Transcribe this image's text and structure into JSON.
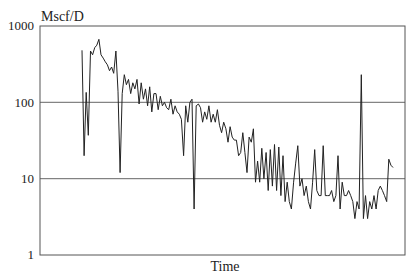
{
  "chart_data": {
    "type": "line",
    "title": "",
    "xlabel": "Time",
    "ylabel": "Mscf/D",
    "yscale": "log",
    "ylim": [
      1,
      1000
    ],
    "yticks": [
      1,
      10,
      100,
      1000
    ],
    "ytick_labels": [
      "1",
      "10",
      "100",
      "1000"
    ],
    "grid": {
      "horizontal": [
        10,
        100
      ],
      "vertical": false
    },
    "legend": null,
    "series": [
      {
        "name": "Gas rate",
        "color": "#222222",
        "x": [
          0,
          1,
          2,
          3,
          4,
          5,
          6,
          7,
          8,
          9,
          10,
          11,
          12,
          13,
          14,
          15,
          16,
          17,
          18,
          19,
          20,
          21,
          22,
          23,
          24,
          25,
          26,
          27,
          28,
          29,
          30,
          31,
          32,
          33,
          34,
          35,
          36,
          37,
          38,
          39,
          40,
          41,
          42,
          43,
          44,
          45,
          46,
          47,
          48,
          49,
          50,
          51,
          52,
          53,
          54,
          55,
          56,
          57,
          58,
          59,
          60,
          61,
          62,
          63,
          64,
          65,
          66,
          67,
          68,
          69,
          70,
          71,
          72,
          73,
          74,
          75,
          76,
          77,
          78,
          79,
          80,
          81,
          82,
          83,
          84,
          85,
          86,
          87,
          88,
          89,
          90,
          91,
          92,
          93,
          94,
          95,
          96,
          97,
          98,
          99,
          100,
          101,
          102,
          103,
          104,
          105,
          106,
          107,
          108,
          109,
          110,
          111,
          112,
          113,
          114,
          115,
          116,
          117,
          118,
          119,
          120,
          121,
          122,
          123,
          124,
          125,
          126,
          127,
          128,
          129,
          130,
          131,
          132,
          133,
          134,
          135,
          136,
          137,
          138,
          139,
          140,
          141,
          142,
          143,
          144,
          145,
          146,
          147
        ],
        "values": [
          480,
          20,
          135,
          37,
          470,
          420,
          520,
          560,
          670,
          420,
          380,
          340,
          310,
          260,
          290,
          240,
          470,
          140,
          12,
          130,
          230,
          170,
          200,
          130,
          180,
          150,
          200,
          95,
          180,
          110,
          150,
          90,
          160,
          75,
          130,
          130,
          80,
          120,
          90,
          100,
          85,
          80,
          110,
          70,
          90,
          75,
          70,
          60,
          20,
          90,
          55,
          100,
          110,
          4,
          90,
          95,
          85,
          55,
          75,
          60,
          90,
          55,
          70,
          55,
          80,
          50,
          40,
          55,
          45,
          30,
          48,
          35,
          32,
          32,
          20,
          22,
          40,
          22,
          12,
          35,
          30,
          45,
          9,
          17,
          9,
          25,
          10,
          22,
          7,
          24,
          8,
          28,
          7,
          26,
          6,
          20,
          5,
          9,
          5,
          4,
          9,
          16,
          27,
          8,
          10,
          6,
          8,
          5,
          4,
          9,
          24,
          7,
          6,
          6,
          27,
          6,
          6,
          6,
          7,
          5,
          6,
          20,
          4,
          9,
          6,
          6,
          7,
          6,
          5,
          3,
          5,
          4,
          230,
          3,
          6,
          3,
          5,
          4,
          6,
          4,
          7,
          8,
          7,
          6,
          5,
          18,
          15,
          14
        ]
      }
    ]
  }
}
